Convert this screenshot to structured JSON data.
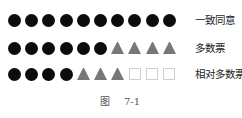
{
  "diagram": {
    "rows": [
      {
        "label": "一致同意",
        "shapes": [
          "circle",
          "circle",
          "circle",
          "circle",
          "circle",
          "circle",
          "circle",
          "circle",
          "circle",
          "circle"
        ]
      },
      {
        "label": "多数票",
        "shapes": [
          "circle",
          "circle",
          "circle",
          "circle",
          "circle",
          "circle",
          "triangle",
          "triangle",
          "triangle",
          "triangle"
        ]
      },
      {
        "label": "相对多数票",
        "shapes": [
          "circle",
          "circle",
          "circle",
          "circle",
          "triangle",
          "triangle",
          "triangle",
          "square",
          "square",
          "square"
        ]
      }
    ],
    "caption_prefix": "图",
    "caption_number": "7-1",
    "colors": {
      "circle": "#0c0c0c",
      "triangle": "#777777",
      "square_border": "#cfcfcf"
    }
  }
}
